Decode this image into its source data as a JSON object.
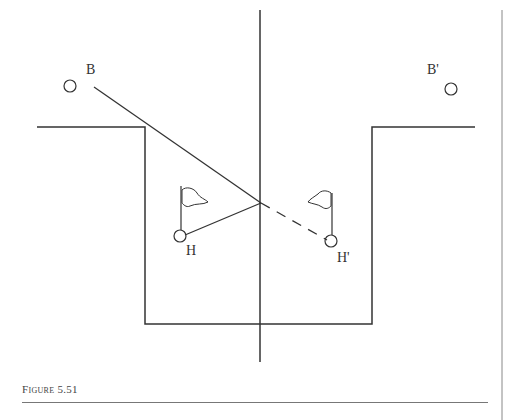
{
  "figure": {
    "caption": "Figure 5.51",
    "labels": {
      "ball": "B",
      "ball_image": "B'",
      "hole": "H",
      "hole_image": "H'"
    },
    "colors": {
      "stroke": "#333333",
      "background": "#ffffff",
      "rule": "#777777"
    }
  }
}
